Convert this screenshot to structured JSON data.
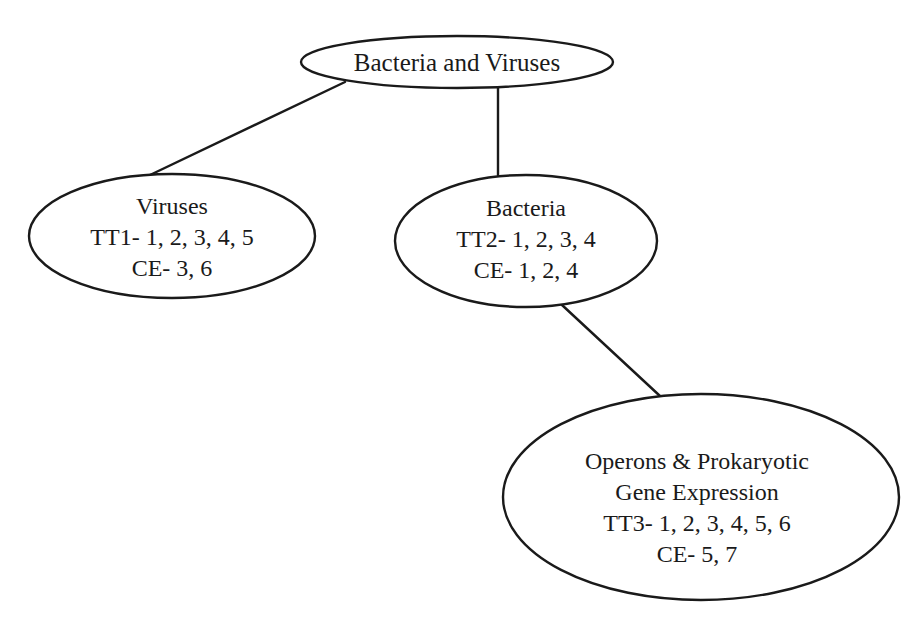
{
  "diagram": {
    "title": "Bacteria and Viruses",
    "colors": {
      "stroke": "#1a1a1a",
      "background": "#ffffff",
      "text": "#1a1a1a"
    },
    "nodes": {
      "root": {
        "lines": [
          "Bacteria and Viruses"
        ]
      },
      "viruses": {
        "lines": [
          "Viruses",
          "TT1- 1, 2, 3, 4, 5",
          "CE- 3, 6"
        ]
      },
      "bacteria": {
        "lines": [
          "Bacteria",
          "TT2- 1, 2, 3, 4",
          "CE- 1, 2, 4"
        ]
      },
      "operons": {
        "lines": [
          "Operons & Prokaryotic",
          "Gene Expression",
          "TT3- 1, 2, 3, 4, 5, 6",
          "CE- 5, 7"
        ]
      }
    },
    "edges": [
      {
        "from": "root",
        "to": "viruses"
      },
      {
        "from": "root",
        "to": "bacteria"
      },
      {
        "from": "bacteria",
        "to": "operons"
      }
    ]
  }
}
